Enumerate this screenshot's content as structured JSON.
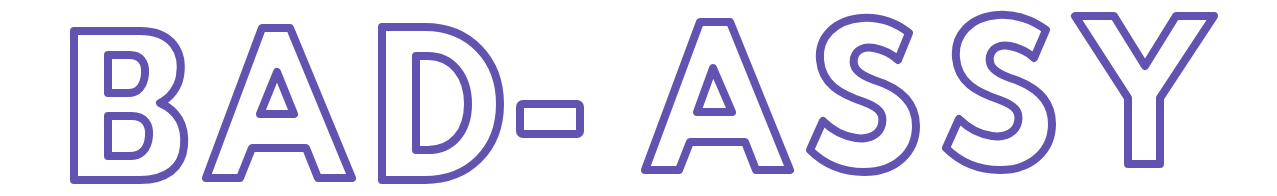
{
  "wordmark": {
    "text": "BAD- ASSY",
    "letters": [
      "B",
      "A",
      "D",
      "-",
      "A",
      "S",
      "S",
      "Y"
    ],
    "style": "outlined",
    "stroke_color": "#6452B0",
    "fill_color": "#FFFFFF",
    "background_color": "#FFFFFF"
  }
}
